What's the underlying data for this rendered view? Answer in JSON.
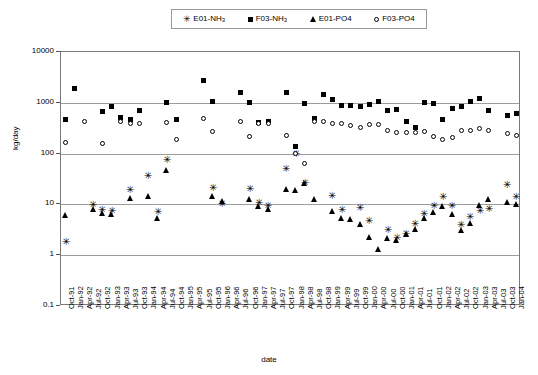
{
  "chart_data": {
    "type": "scatter",
    "title": "",
    "xlabel": "date",
    "ylabel": "kg/day",
    "yscale": "log",
    "ylim": [
      0.1,
      10000
    ],
    "yticks": [
      "10000",
      "1000",
      "100",
      "10",
      "1",
      "0.1"
    ],
    "grid": true,
    "legend_position": "top-center",
    "categories": [
      "Oct-91",
      "Jan-92",
      "Apr-92",
      "Jul-92",
      "Oct-92",
      "Jan-93",
      "Apr-93",
      "Jul-93",
      "Oct-93",
      "Jan-94",
      "Apr-94",
      "Jul-94",
      "Oct-94",
      "Jan-95",
      "Apr-95",
      "Jul-95",
      "Oct-95",
      "Jan-96",
      "Apr-96",
      "Jul-96",
      "Oct-96",
      "Jan-97",
      "Apr-97",
      "Jul-97",
      "Oct-97",
      "Jan-98",
      "Apr-98",
      "Jul-98",
      "Oct-98",
      "Jan-99",
      "Apr-99",
      "Jul-99",
      "Oct-99",
      "Jan-00",
      "Apr-00",
      "Jul-00",
      "Oct-00",
      "Jan-01",
      "Apr-01",
      "Jul-01",
      "Oct-01",
      "Jan-02",
      "Apr-02",
      "Jul-02",
      "Oct-02",
      "Jan-03",
      "Apr-03",
      "Jul-03",
      "Oct-03",
      "Jan-04"
    ],
    "series": [
      {
        "name": "E01-NH3",
        "marker": "star",
        "points": [
          {
            "x": 0,
            "y": 1.75
          },
          {
            "x": 3,
            "y": 9.5
          },
          {
            "x": 4,
            "y": 7.6
          },
          {
            "x": 5,
            "y": 7.2
          },
          {
            "x": 7,
            "y": 19.0
          },
          {
            "x": 9,
            "y": 36.0
          },
          {
            "x": 10,
            "y": 7.0
          },
          {
            "x": 11,
            "y": 73.0
          },
          {
            "x": 16,
            "y": 21.0
          },
          {
            "x": 17,
            "y": 10.0
          },
          {
            "x": 20,
            "y": 20.0
          },
          {
            "x": 21,
            "y": 10.5
          },
          {
            "x": 22,
            "y": 9.0
          },
          {
            "x": 24,
            "y": 48.0
          },
          {
            "x": 25,
            "y": 95.0
          },
          {
            "x": 26,
            "y": 26.0
          },
          {
            "x": 29,
            "y": 14.0
          },
          {
            "x": 30,
            "y": 7.6
          },
          {
            "x": 32,
            "y": 8.3
          },
          {
            "x": 33,
            "y": 4.6
          },
          {
            "x": 35,
            "y": 3.0
          },
          {
            "x": 36,
            "y": 2.1
          },
          {
            "x": 37,
            "y": 2.6
          },
          {
            "x": 38,
            "y": 4.0
          },
          {
            "x": 39,
            "y": 6.2
          },
          {
            "x": 40,
            "y": 9.3
          },
          {
            "x": 41,
            "y": 13.5
          },
          {
            "x": 42,
            "y": 9.2
          },
          {
            "x": 43,
            "y": 3.8
          },
          {
            "x": 44,
            "y": 5.6
          },
          {
            "x": 45,
            "y": 7.3
          },
          {
            "x": 46,
            "y": 7.9
          },
          {
            "x": 48,
            "y": 24.0
          },
          {
            "x": 49,
            "y": 13.5
          }
        ]
      },
      {
        "name": "F03-NH3",
        "marker": "square",
        "points": [
          {
            "x": 0,
            "y": 470
          },
          {
            "x": 1,
            "y": 1950
          },
          {
            "x": 4,
            "y": 670
          },
          {
            "x": 5,
            "y": 860
          },
          {
            "x": 6,
            "y": 520
          },
          {
            "x": 7,
            "y": 470
          },
          {
            "x": 8,
            "y": 700
          },
          {
            "x": 11,
            "y": 1000
          },
          {
            "x": 12,
            "y": 470
          },
          {
            "x": 15,
            "y": 2700
          },
          {
            "x": 16,
            "y": 1050
          },
          {
            "x": 19,
            "y": 1600
          },
          {
            "x": 20,
            "y": 1000
          },
          {
            "x": 21,
            "y": 410
          },
          {
            "x": 22,
            "y": 430
          },
          {
            "x": 24,
            "y": 1600
          },
          {
            "x": 25,
            "y": 135
          },
          {
            "x": 26,
            "y": 980
          },
          {
            "x": 27,
            "y": 500
          },
          {
            "x": 28,
            "y": 1450
          },
          {
            "x": 29,
            "y": 1150
          },
          {
            "x": 30,
            "y": 900
          },
          {
            "x": 31,
            "y": 880
          },
          {
            "x": 32,
            "y": 830
          },
          {
            "x": 33,
            "y": 930
          },
          {
            "x": 34,
            "y": 1070
          },
          {
            "x": 35,
            "y": 700
          },
          {
            "x": 36,
            "y": 730
          },
          {
            "x": 37,
            "y": 420
          },
          {
            "x": 38,
            "y": 320
          },
          {
            "x": 39,
            "y": 1000
          },
          {
            "x": 40,
            "y": 950
          },
          {
            "x": 41,
            "y": 470
          },
          {
            "x": 42,
            "y": 780
          },
          {
            "x": 43,
            "y": 830
          },
          {
            "x": 44,
            "y": 1050
          },
          {
            "x": 45,
            "y": 1200
          },
          {
            "x": 46,
            "y": 720
          },
          {
            "x": 48,
            "y": 560
          },
          {
            "x": 49,
            "y": 620
          }
        ]
      },
      {
        "name": "E01-PO4",
        "marker": "triangle",
        "points": [
          {
            "x": 0,
            "y": 6.2
          },
          {
            "x": 3,
            "y": 8.3
          },
          {
            "x": 4,
            "y": 6.8
          },
          {
            "x": 5,
            "y": 6.6
          },
          {
            "x": 7,
            "y": 13.5
          },
          {
            "x": 9,
            "y": 14.5
          },
          {
            "x": 10,
            "y": 5.5
          },
          {
            "x": 11,
            "y": 47.0
          },
          {
            "x": 16,
            "y": 14.5
          },
          {
            "x": 17,
            "y": 11.5
          },
          {
            "x": 20,
            "y": 12.5
          },
          {
            "x": 21,
            "y": 9.4
          },
          {
            "x": 22,
            "y": 8.0
          },
          {
            "x": 24,
            "y": 20.0
          },
          {
            "x": 25,
            "y": 19.5
          },
          {
            "x": 26,
            "y": 26.5
          },
          {
            "x": 27,
            "y": 13.0
          },
          {
            "x": 29,
            "y": 7.5
          },
          {
            "x": 30,
            "y": 5.3
          },
          {
            "x": 31,
            "y": 5.2
          },
          {
            "x": 32,
            "y": 4.2
          },
          {
            "x": 33,
            "y": 2.3
          },
          {
            "x": 34,
            "y": 1.3
          },
          {
            "x": 35,
            "y": 2.2
          },
          {
            "x": 36,
            "y": 2.0
          },
          {
            "x": 37,
            "y": 2.6
          },
          {
            "x": 38,
            "y": 3.3
          },
          {
            "x": 39,
            "y": 5.3
          },
          {
            "x": 40,
            "y": 7.0
          },
          {
            "x": 41,
            "y": 9.3
          },
          {
            "x": 42,
            "y": 6.5
          },
          {
            "x": 43,
            "y": 3.2
          },
          {
            "x": 44,
            "y": 4.3
          },
          {
            "x": 45,
            "y": 9.7
          },
          {
            "x": 46,
            "y": 12.5
          },
          {
            "x": 48,
            "y": 11.0
          },
          {
            "x": 49,
            "y": 10.0
          }
        ]
      },
      {
        "name": "F03-PO4",
        "marker": "circle",
        "points": [
          {
            "x": 0,
            "y": 165
          },
          {
            "x": 2,
            "y": 430
          },
          {
            "x": 4,
            "y": 160
          },
          {
            "x": 6,
            "y": 420
          },
          {
            "x": 7,
            "y": 400
          },
          {
            "x": 8,
            "y": 400
          },
          {
            "x": 11,
            "y": 410
          },
          {
            "x": 12,
            "y": 190
          },
          {
            "x": 15,
            "y": 500
          },
          {
            "x": 16,
            "y": 270
          },
          {
            "x": 19,
            "y": 430
          },
          {
            "x": 20,
            "y": 215
          },
          {
            "x": 21,
            "y": 400
          },
          {
            "x": 22,
            "y": 400
          },
          {
            "x": 24,
            "y": 230
          },
          {
            "x": 25,
            "y": 100
          },
          {
            "x": 26,
            "y": 63
          },
          {
            "x": 27,
            "y": 420
          },
          {
            "x": 28,
            "y": 430
          },
          {
            "x": 29,
            "y": 400
          },
          {
            "x": 30,
            "y": 390
          },
          {
            "x": 31,
            "y": 350
          },
          {
            "x": 32,
            "y": 330
          },
          {
            "x": 33,
            "y": 370
          },
          {
            "x": 34,
            "y": 380
          },
          {
            "x": 35,
            "y": 280
          },
          {
            "x": 36,
            "y": 265
          },
          {
            "x": 37,
            "y": 260
          },
          {
            "x": 38,
            "y": 255
          },
          {
            "x": 39,
            "y": 270
          },
          {
            "x": 40,
            "y": 215
          },
          {
            "x": 41,
            "y": 190
          },
          {
            "x": 42,
            "y": 205
          },
          {
            "x": 43,
            "y": 290
          },
          {
            "x": 44,
            "y": 290
          },
          {
            "x": 45,
            "y": 310
          },
          {
            "x": 46,
            "y": 290
          },
          {
            "x": 48,
            "y": 250
          },
          {
            "x": 49,
            "y": 230
          }
        ]
      }
    ]
  },
  "legend": {
    "items": [
      {
        "label_base": "E01-NH",
        "label_sub": "3",
        "marker": "star"
      },
      {
        "label_base": "F03-NH",
        "label_sub": "3",
        "marker": "square"
      },
      {
        "label_base": "E01-PO4",
        "label_sub": "",
        "marker": "triangle"
      },
      {
        "label_base": "F03-PO4",
        "label_sub": "",
        "marker": "circle"
      }
    ]
  },
  "axes": {
    "ylabel": "kg/day",
    "xlabel": "date"
  }
}
